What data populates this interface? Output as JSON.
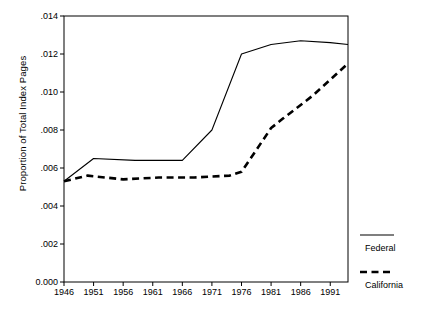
{
  "chart_data": {
    "type": "line",
    "title": "",
    "xlabel": "",
    "ylabel": "Proportion of Total Index Pages",
    "xlim": [
      1946,
      1994
    ],
    "ylim": [
      0.0,
      0.014
    ],
    "grid": false,
    "legend_position": "right",
    "xticks": [
      1946,
      1951,
      1956,
      1961,
      1966,
      1971,
      1976,
      1981,
      1986,
      1991
    ],
    "xtick_labels": [
      "1946",
      "1951",
      "1956",
      "1961",
      "1966",
      "1971",
      "1976",
      "1981",
      "1986",
      "1991"
    ],
    "yticks": [
      0.0,
      0.002,
      0.004,
      0.006,
      0.008,
      0.01,
      0.012,
      0.014
    ],
    "ytick_labels": [
      "0.000",
      ".002",
      ".004",
      ".006",
      ".008",
      ".010",
      ".012",
      ".014"
    ],
    "series": [
      {
        "name": "Federal",
        "style": "solid",
        "color": "#000000",
        "x": [
          1946,
          1951,
          1958,
          1966,
          1971,
          1976,
          1981,
          1986,
          1991,
          1994
        ],
        "values": [
          0.0053,
          0.0065,
          0.0064,
          0.0064,
          0.008,
          0.012,
          0.0125,
          0.0127,
          0.0126,
          0.0125
        ]
      },
      {
        "name": "California",
        "style": "dashed",
        "color": "#000000",
        "x": [
          1946,
          1950,
          1956,
          1962,
          1968,
          1974,
          1976,
          1981,
          1983,
          1988,
          1994
        ],
        "values": [
          0.0053,
          0.0056,
          0.0054,
          0.0055,
          0.0055,
          0.0056,
          0.0058,
          0.0081,
          0.0086,
          0.0098,
          0.0115
        ]
      }
    ]
  },
  "legend": {
    "entries": [
      {
        "label": "Federal",
        "style": "solid"
      },
      {
        "label": "California",
        "style": "dashed"
      }
    ]
  }
}
